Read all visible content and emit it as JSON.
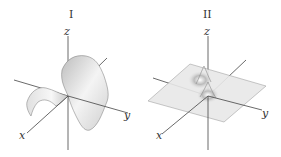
{
  "figure": {
    "panels": [
      {
        "label": "I",
        "description": "saddle-shaped surface",
        "axes": {
          "x": "x",
          "y": "y",
          "z": "z"
        }
      },
      {
        "label": "II",
        "description": "flat plane with central double peak",
        "axes": {
          "x": "x",
          "y": "y",
          "z": "z"
        }
      }
    ]
  },
  "colors": {
    "axis": "#444444",
    "surface_light": "#f2f2f2",
    "surface_mid": "#d8d8d8",
    "surface_dark": "#9a9a9a",
    "plane": "#e6e6e6"
  }
}
